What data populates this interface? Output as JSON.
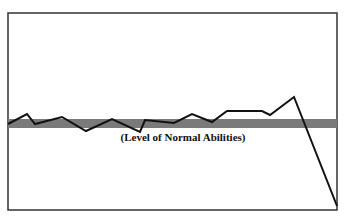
{
  "chart_data": {
    "type": "line",
    "title": "",
    "xlabel": "",
    "ylabel": "",
    "grid": false,
    "legend": null,
    "annotations": [
      {
        "text": "(Level of Normal Abilities)",
        "position": "below band, centered"
      }
    ],
    "reference_band": {
      "label": "(Level of Normal Abilities)",
      "color": "#7a7a7a",
      "y_range_px": [
        119,
        128
      ]
    },
    "series": [
      {
        "name": "abilities",
        "color": "#111111",
        "points_px": [
          [
            8,
            124
          ],
          [
            27,
            114
          ],
          [
            35,
            124
          ],
          [
            62,
            117
          ],
          [
            86,
            131
          ],
          [
            112,
            119
          ],
          [
            140,
            132
          ],
          [
            145,
            120
          ],
          [
            174,
            123
          ],
          [
            192,
            114
          ],
          [
            212,
            122
          ],
          [
            227,
            111
          ],
          [
            262,
            111
          ],
          [
            270,
            115
          ],
          [
            294,
            97
          ],
          [
            337,
            206
          ]
        ]
      }
    ],
    "frame": {
      "x": 8,
      "y": 13,
      "width": 329,
      "height": 197,
      "color": "#333333"
    }
  },
  "labels": {
    "band_label": "(Level of Normal Abilities)"
  }
}
